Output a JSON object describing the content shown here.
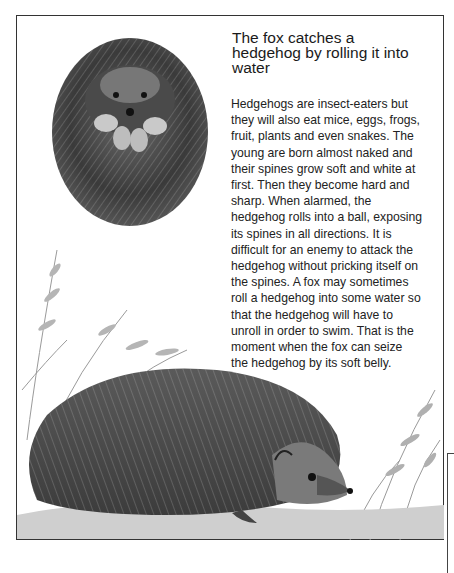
{
  "article": {
    "title": "The fox catches a hedgehog by rolling it into water",
    "title_lines": [
      "The fox catches a",
      "hedgehog by rolling it into",
      "water"
    ],
    "body_lines": [
      "Hedgehogs are insect-eaters but",
      "they will also eat mice, eggs, frogs,",
      "fruit, plants and even snakes. The",
      "young are born almost naked and",
      "their spines grow soft and white at",
      "first. Then they become hard and",
      "sharp. When alarmed, the",
      "hedgehog rolls into a ball, exposing",
      "its spines in all directions. It is",
      "difficult for an enemy to attack the",
      "hedgehog without pricking itself on",
      "the spines. A fox may sometimes",
      "roll a hedgehog into some water so",
      "that the hedgehog will have to",
      "unroll in order to swim. That is the",
      "moment when the fox can seize",
      "the hedgehog by its soft belly."
    ]
  },
  "illustrations": {
    "top": "Hedgehog curled up in a ball",
    "bottom": "Hedgehog walking among ferns and plants"
  }
}
